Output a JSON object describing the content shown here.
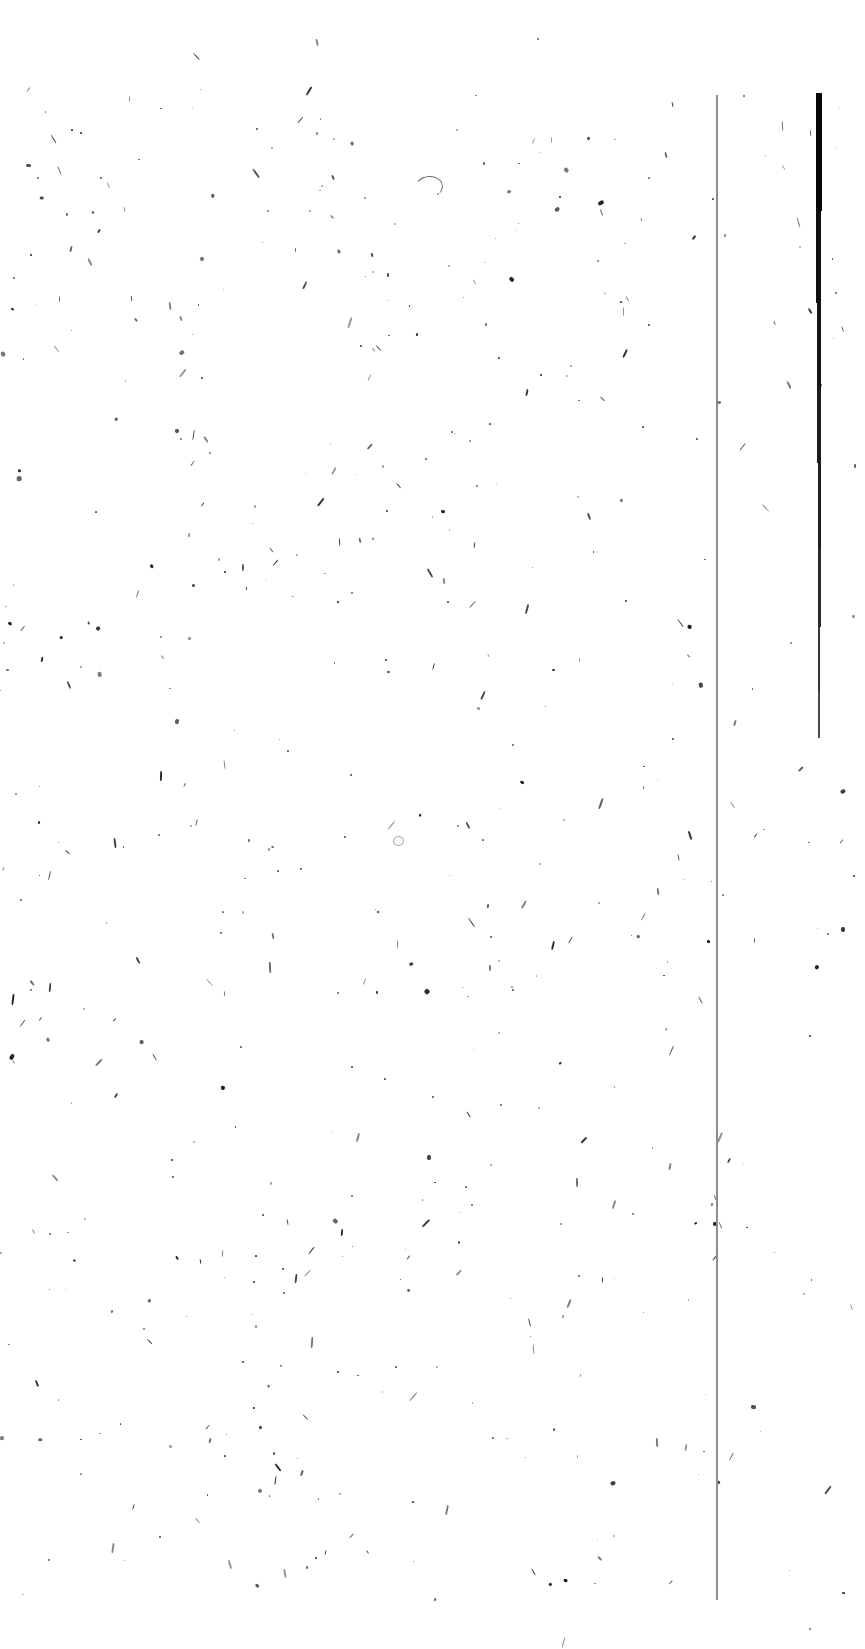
{
  "document": {
    "kind": "scanned-page-image",
    "page_label": "",
    "visible_text": "",
    "description": "Blank scanned document page with binarization speckle noise and two vertical rule lines near the right margin",
    "width_px": 865,
    "height_px": 1649,
    "background_color": "#ffffff",
    "ink_color": "#1b1b1b"
  },
  "rules": {
    "thin_rule": {
      "name": "thin-vertical-rule",
      "x_px": 716,
      "top_px": 95,
      "bottom_px": 1600,
      "width_px": 2,
      "color": "#8d8d8d"
    },
    "thick_rule": {
      "name": "thick-vertical-rule",
      "x_px": 816,
      "top_px": 93,
      "bottom_px": 738,
      "max_width_px": 6,
      "min_width_px": 2,
      "color": "#0a0a0a",
      "segments": [
        {
          "top": 93,
          "height": 118,
          "left": 816,
          "width": 6,
          "color": "#070707"
        },
        {
          "top": 211,
          "height": 92,
          "left": 816,
          "width": 5,
          "color": "#101010"
        },
        {
          "top": 303,
          "height": 86,
          "left": 817,
          "width": 4,
          "color": "#161616"
        },
        {
          "top": 389,
          "height": 74,
          "left": 817,
          "width": 3.5,
          "color": "#1c1c1c"
        },
        {
          "top": 463,
          "height": 86,
          "left": 818,
          "width": 3,
          "color": "#202020"
        },
        {
          "top": 549,
          "height": 78,
          "left": 818,
          "width": 2.6,
          "color": "#2a2a2a"
        },
        {
          "top": 627,
          "height": 64,
          "left": 818,
          "width": 2.2,
          "color": "#343434"
        },
        {
          "top": 691,
          "height": 47,
          "left": 818,
          "width": 1.8,
          "color": "#4a4a4a"
        }
      ]
    }
  },
  "glyph_marks": [
    {
      "name": "arch-fragment",
      "type": "arc",
      "x": 415,
      "y": 176,
      "w": 26,
      "h": 20,
      "rotate": -8
    },
    {
      "name": "ring-fragment",
      "type": "ring",
      "x": 393,
      "y": 836,
      "w": 9,
      "h": 8,
      "rotate": 0
    }
  ],
  "speckle": {
    "name": "scanner-speckle-noise",
    "seed": 20240517,
    "count": 560,
    "min_size_px": 1,
    "max_size_px": 5,
    "zones": [
      {
        "x": 0,
        "y": 80,
        "w": 716,
        "h": 1520,
        "density": 1.0
      },
      {
        "x": 716,
        "y": 80,
        "w": 149,
        "h": 1520,
        "density": 0.55
      },
      {
        "x": 0,
        "y": 1600,
        "w": 865,
        "h": 49,
        "density": 0.08
      },
      {
        "x": 0,
        "y": 0,
        "w": 865,
        "h": 80,
        "density": 0.05
      }
    ]
  }
}
